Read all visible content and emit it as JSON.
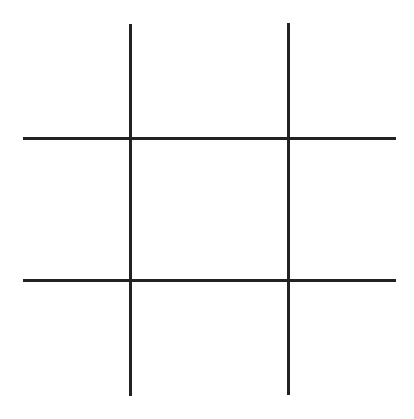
{
  "game": {
    "name": "tic-tac-toe",
    "line_color": "#222222",
    "background_color": "#ffffff",
    "board": [
      [
        "",
        "",
        ""
      ],
      [
        "",
        "",
        ""
      ],
      [
        "",
        "",
        ""
      ]
    ]
  }
}
